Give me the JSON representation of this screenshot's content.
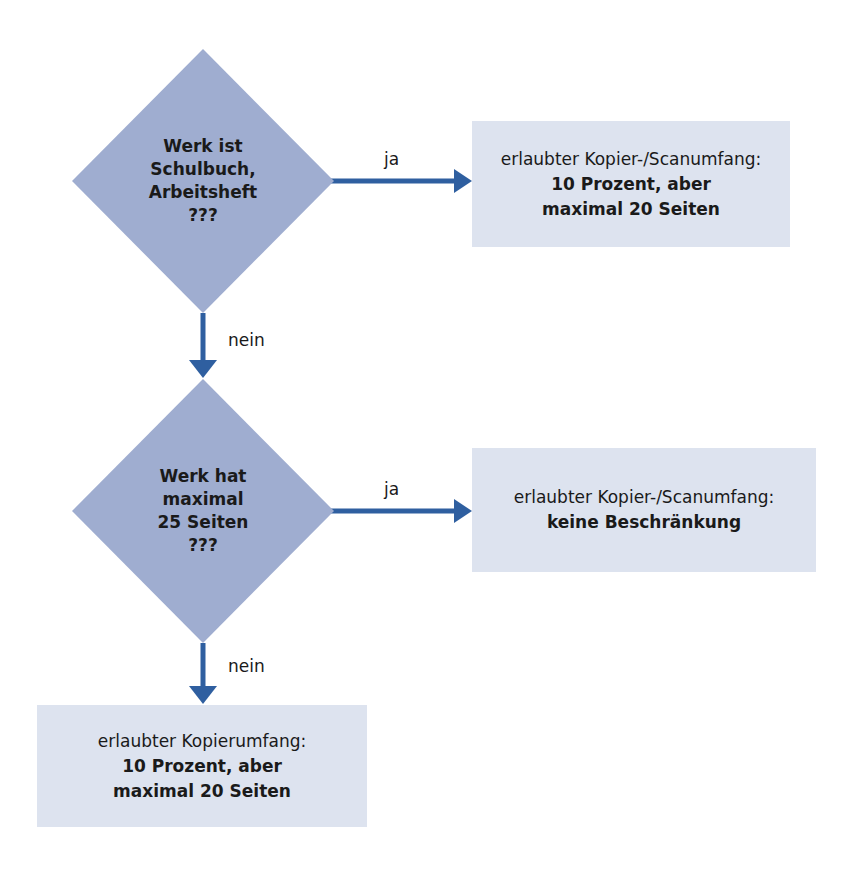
{
  "colors": {
    "diamond_fill": "#9fadd0",
    "box_fill": "#dde3ef",
    "arrow": "#2f5fa0",
    "text": "#1a1a1a"
  },
  "decisions": [
    {
      "lines": [
        "Werk ist",
        "Schulbuch,",
        "Arbeitsheft",
        "???"
      ]
    },
    {
      "lines": [
        "Werk hat",
        "maximal",
        "25 Seiten",
        "???"
      ]
    }
  ],
  "results": [
    {
      "intro": "erlaubter Kopier-/Scanumfang:",
      "bold_lines": [
        "10 Prozent, aber",
        "maximal 20 Seiten"
      ]
    },
    {
      "intro": "erlaubter Kopier-/Scanumfang:",
      "bold_lines": [
        "keine Beschränkung"
      ]
    },
    {
      "intro": "erlaubter Kopierumfang:",
      "bold_lines": [
        "10 Prozent, aber",
        "maximal 20 Seiten"
      ]
    }
  ],
  "edges": [
    {
      "from": "decision-1",
      "to": "result-1",
      "label": "ja"
    },
    {
      "from": "decision-1",
      "to": "decision-2",
      "label": "nein"
    },
    {
      "from": "decision-2",
      "to": "result-2",
      "label": "ja"
    },
    {
      "from": "decision-2",
      "to": "result-3",
      "label": "nein"
    }
  ]
}
